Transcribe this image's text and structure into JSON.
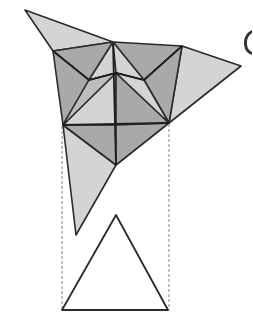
{
  "figure": {
    "partial_label": "(",
    "colors": {
      "light_face": "#d4d4d4",
      "dark_face": "#a9a9a9",
      "mid_face": "#bdbdbd",
      "stroke": "#2a2a2a",
      "dash": "#777777"
    }
  }
}
